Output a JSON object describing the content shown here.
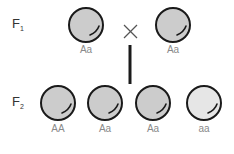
{
  "f1": {
    "label": "F",
    "sub": "1",
    "parents": [
      {
        "genotype": "Aa",
        "fill": "#cccccc"
      },
      {
        "genotype": "Aa",
        "fill": "#cccccc"
      }
    ],
    "cross_symbol": "×"
  },
  "f2": {
    "label": "F",
    "sub": "2",
    "offspring": [
      {
        "genotype": "AA",
        "fill": "#cccccc"
      },
      {
        "genotype": "Aa",
        "fill": "#cccccc"
      },
      {
        "genotype": "Aa",
        "fill": "#cccccc"
      },
      {
        "genotype": "aa",
        "fill": "#e6e6e6"
      }
    ]
  }
}
